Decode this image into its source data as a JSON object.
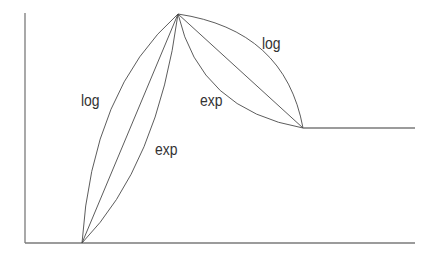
{
  "diagram": {
    "type": "envelope-curves",
    "colors": {
      "axis": "#7a7a7a",
      "curve": "#4a4a4a",
      "text": "#333333",
      "background": "#ffffff"
    },
    "labels": {
      "attack_log": "log",
      "attack_exp": "exp",
      "decay_exp": "exp",
      "decay_log": "log"
    },
    "points": {
      "origin": [
        25,
        243
      ],
      "start": [
        82,
        243
      ],
      "peak": [
        178,
        14
      ],
      "sustain_start": [
        303,
        128
      ],
      "sustain_end": [
        415,
        128
      ],
      "axis_x_end": [
        415,
        243
      ],
      "axis_y_top": [
        25,
        13
      ]
    }
  }
}
